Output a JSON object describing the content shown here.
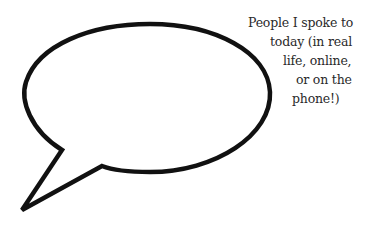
{
  "caption": {
    "lines": [
      "People I spoke to",
      "today (in real",
      "life, online,",
      "or on the",
      "phone!)"
    ]
  },
  "bubble": {
    "icon": "speech-bubble-icon",
    "stroke_color": "#111111",
    "fill_color": "#ffffff"
  }
}
